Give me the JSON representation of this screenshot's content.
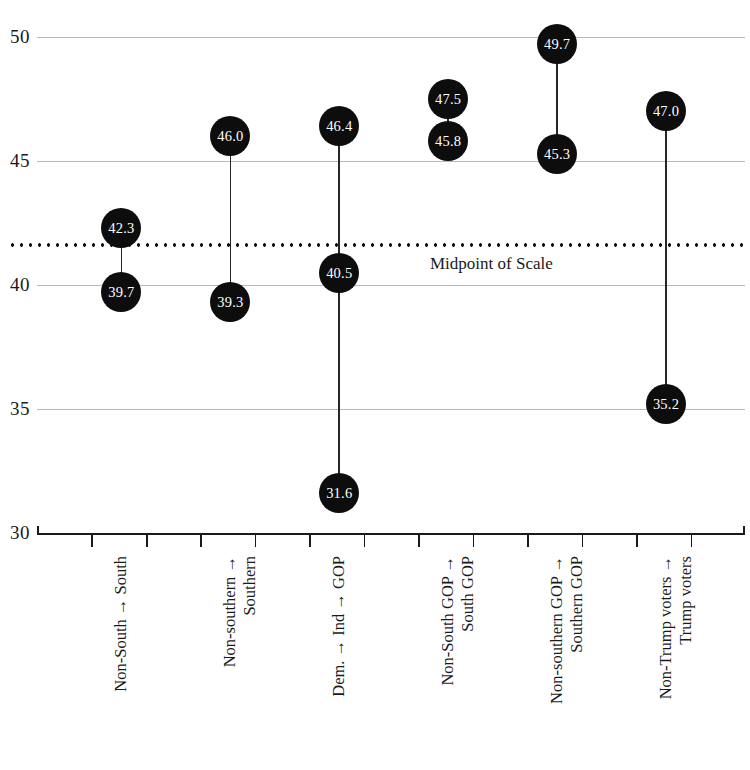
{
  "chart_data": {
    "type": "scatter",
    "title": "",
    "subtitle": "",
    "xlabel": "",
    "ylabel": "",
    "ylim": [
      30,
      50
    ],
    "yticks": [
      50,
      45,
      40,
      35,
      30
    ],
    "ytick_labels": [
      "50",
      "45",
      "40",
      "35",
      "30"
    ],
    "grid": true,
    "legend": null,
    "annotations": [
      {
        "name": "midpoint-of-scale",
        "text": "Midpoint of Scale",
        "value": 41.6,
        "style": "dotted-horizontal-line"
      }
    ],
    "categories": [
      "Non-South → South",
      "Non-southern → Southern",
      "Dem. → Ind → GOP",
      "Non-South GOP → South GOP",
      "Non-southern GOP → Southern GOP",
      "Non-Trump voters → Trump voters"
    ],
    "groups": [
      {
        "id": "non-south-to-south",
        "label_line1": "Non-South → South",
        "label_line2": "",
        "values": [
          42.3,
          39.7
        ],
        "value_labels": [
          "42.3",
          "39.7"
        ]
      },
      {
        "id": "non-southern-to-southern",
        "label_line1": "Non-southern →",
        "label_line2": "Southern",
        "values": [
          46.0,
          39.3
        ],
        "value_labels": [
          "46.0",
          "39.3"
        ]
      },
      {
        "id": "dem-to-ind-to-gop",
        "label_line1": "Dem. → Ind → GOP",
        "label_line2": "",
        "values": [
          46.4,
          40.5,
          31.6
        ],
        "value_labels": [
          "46.4",
          "40.5",
          "31.6"
        ]
      },
      {
        "id": "non-south-gop-to-south-gop",
        "label_line1": "Non-South GOP →",
        "label_line2": "South GOP",
        "values": [
          47.5,
          45.8
        ],
        "value_labels": [
          "47.5",
          "45.8"
        ]
      },
      {
        "id": "non-southern-gop-to-southern-gop",
        "label_line1": "Non-southern GOP →",
        "label_line2": "Southern GOP",
        "values": [
          49.7,
          45.3
        ],
        "value_labels": [
          "49.7",
          "45.3"
        ]
      },
      {
        "id": "non-trump-voters-to-trump-voters",
        "label_line1": "Non-Trump voters →",
        "label_line2": "Trump voters",
        "values": [
          47.0,
          35.2
        ],
        "value_labels": [
          "47.0",
          "35.2"
        ]
      }
    ],
    "colors": {
      "marker": "#0d0d0d",
      "marker_text": "#ffffff",
      "gridline": "#b9b9b9",
      "axis": "#1a1a1a",
      "midpoint": "#111111",
      "background": "#ffffff"
    }
  }
}
